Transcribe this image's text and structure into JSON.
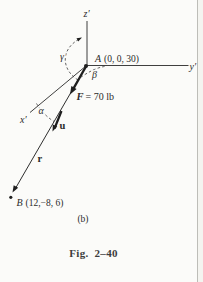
{
  "figure": {
    "part_label": "(b)",
    "caption": "Fig. 2–40",
    "axes": {
      "z_label": "z′",
      "y_label": "y′",
      "x_label": "x′"
    },
    "points": {
      "A": {
        "symbol": "A",
        "coords": "(0, 0, 30)"
      },
      "B": {
        "symbol": "B",
        "coords": "(12,−8, 6)"
      }
    },
    "force": {
      "symbol": "F",
      "value": "= 70 lb"
    },
    "vectors": {
      "unit": "u",
      "position": "r"
    },
    "angles": {
      "gamma": "γ",
      "beta": "β",
      "alpha": "α"
    },
    "colors": {
      "ink": "#2b2b2b",
      "caption_ink": "#3d3d3d",
      "background": "#fbfbf9",
      "page_edge": "#bdbdb8"
    }
  }
}
